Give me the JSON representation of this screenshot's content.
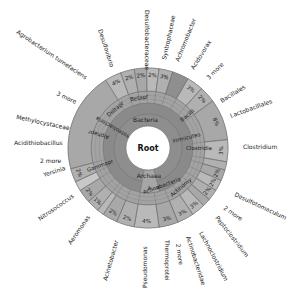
{
  "chart_data": {
    "type": "sunburst",
    "title": "",
    "center": {
      "x": 148,
      "y": 148
    },
    "root_label": "Root",
    "rings": {
      "root_r": 22,
      "domain": [
        22,
        34
      ],
      "phylum": [
        34,
        45
      ],
      "class": [
        45,
        57
      ],
      "order": [
        57,
        66
      ],
      "genus": [
        66,
        80
      ]
    },
    "colors": {
      "root": "#ffffff",
      "bacteria": "#8e8e8e",
      "archaea": "#a6a6a6",
      "ring_light": "#b9b9b9",
      "ring_mid": "#a3a3a3",
      "ring_dark": "#8a8a8a",
      "highlight": "#c8c8c8",
      "stroke": "#6e6e6e",
      "text": "#222222"
    },
    "domains": [
      {
        "label": "Bacteria",
        "start": -170,
        "end": 165
      },
      {
        "label": "Archaea",
        "start": 165,
        "end": 190
      }
    ],
    "inner_labels": [
      {
        "label": "Bacteria",
        "angle": -5,
        "r": 28
      },
      {
        "label": "Archaea",
        "angle": 178,
        "r": 28
      },
      {
        "label": "Proteobacteria",
        "angle": -60,
        "r": 40
      },
      {
        "label": "Firmicutes",
        "angle": 75,
        "r": 40
      },
      {
        "label": "Actinobacteria",
        "angle": 160,
        "r": 40
      },
      {
        "label": "A...a",
        "angle": 172,
        "r": 40
      },
      {
        "label": "Gammapr",
        "angle": -110,
        "r": 51
      },
      {
        "label": "Deltapr",
        "angle": -40,
        "r": 51
      },
      {
        "label": "Betapr",
        "angle": -10,
        "r": 51
      },
      {
        "label": "Alphapr",
        "angle": -75,
        "r": 51
      },
      {
        "label": "Clostridia",
        "angle": 90,
        "r": 51
      },
      {
        "label": "Bacilli",
        "angle": 50,
        "r": 51
      },
      {
        "label": "Actinomy",
        "angle": 140,
        "r": 51
      }
    ],
    "segments": [
      {
        "label": "Desulfovibrio",
        "pct": "4%",
        "start": -32,
        "end": -20
      },
      {
        "label": "Desulfobacteraceae",
        "pct": "2%",
        "start": -20,
        "end": -10
      },
      {
        "label": "Syntrophaceae",
        "pct": "2%",
        "start": -10,
        "end": -1
      },
      {
        "label": "Achromobacter",
        "pct": "2%",
        "start": -1,
        "end": 8
      },
      {
        "label": "Acidovorax",
        "pct": "3%",
        "start": 8,
        "end": 18
      },
      {
        "label": "3 more",
        "pct": "",
        "start": 18,
        "end": 30
      },
      {
        "label": "Bacillales",
        "pct": "3%",
        "start": 30,
        "end": 42
      },
      {
        "label": "Lactobacillales",
        "pct": "2%",
        "start": 42,
        "end": 54
      },
      {
        "label": "Clostridium",
        "pct": "8%",
        "start": 54,
        "end": 84
      },
      {
        "label": "Desulfotomaculum",
        "pct": "3%",
        "start": 84,
        "end": 100
      },
      {
        "label": "2 more",
        "pct": "",
        "start": 100,
        "end": 106
      },
      {
        "label": "Peptoclostridium",
        "pct": "2%",
        "start": 106,
        "end": 114
      },
      {
        "label": "Lachnoclostridium",
        "pct": "2%",
        "start": 114,
        "end": 122
      },
      {
        "label": "Actinobacteridae",
        "pct": "2%",
        "start": 122,
        "end": 130
      },
      {
        "label": "2 more",
        "pct": "",
        "start": 130,
        "end": 136
      },
      {
        "label": "Thermoprotei",
        "pct": "3%",
        "start": 136,
        "end": 146
      },
      {
        "label": "Pseudomonas",
        "pct": "3%",
        "start": 146,
        "end": 158
      },
      {
        "label": "Acinetobacter",
        "pct": "3%",
        "start": 158,
        "end": 172
      },
      {
        "label": "Aeromonas",
        "pct": "4%",
        "start": 172,
        "end": 190
      },
      {
        "label": "Nitrosococcus",
        "pct": "2%",
        "start": 190,
        "end": 203
      },
      {
        "label": "Yersinia",
        "pct": "2%",
        "start": 203,
        "end": 214
      },
      {
        "label": "2 more",
        "pct": "",
        "start": 214,
        "end": 219
      },
      {
        "label": "Acidithiobacillus",
        "pct": "1%",
        "start": 219,
        "end": 228
      },
      {
        "label": "Methylocystaceae",
        "pct": "2%",
        "start": 228,
        "end": 238
      },
      {
        "label": "3 more",
        "pct": "",
        "start": 238,
        "end": 245
      },
      {
        "label": "Agrobacterium tumefaciens",
        "pct": "2%",
        "start": 245,
        "end": 255
      },
      {
        "label": "Desulfovibrio",
        "pct": "",
        "start": 255,
        "end": 328
      }
    ],
    "outer_labels": [
      {
        "text": "Desulfovibrio",
        "x": 98,
        "y": 30,
        "rot": 72
      },
      {
        "text": "Desulfobacteraceae",
        "x": 145,
        "y": 10,
        "rot": 90
      },
      {
        "text": "Syntrophaceae",
        "x": 166,
        "y": 60,
        "rot": -78
      },
      {
        "text": "Achromobacter",
        "x": 179,
        "y": 62,
        "rot": -68
      },
      {
        "text": "Acidovorax",
        "x": 194,
        "y": 70,
        "rot": -58
      },
      {
        "text": "3 more",
        "x": 209,
        "y": 80,
        "rot": -45
      },
      {
        "text": "Bacillales",
        "x": 222,
        "y": 103,
        "rot": -32
      },
      {
        "text": "Lactobacillales",
        "x": 231,
        "y": 118,
        "rot": -20
      },
      {
        "text": "Clostridium",
        "x": 243,
        "y": 149,
        "rot": 0
      },
      {
        "text": "Desulfotomaculum",
        "x": 234,
        "y": 196,
        "rot": 25
      },
      {
        "text": "2 more",
        "x": 223,
        "y": 209,
        "rot": 35
      },
      {
        "text": "Peptoclostridium",
        "x": 215,
        "y": 218,
        "rot": 52
      },
      {
        "text": "Lachnoclostridium",
        "x": 199,
        "y": 233,
        "rot": 62
      },
      {
        "text": "Actinobacteridae",
        "x": 186,
        "y": 237,
        "rot": 72
      },
      {
        "text": "2 more",
        "x": 176,
        "y": 244,
        "rot": 82
      },
      {
        "text": "Thermoprotei",
        "x": 165,
        "y": 240,
        "rot": 90
      },
      {
        "text": "Pseudomonas",
        "x": 147,
        "y": 288,
        "rot": -90
      },
      {
        "text": "Acinetobacter",
        "x": 107,
        "y": 281,
        "rot": -74
      },
      {
        "text": "Aeromonas",
        "x": 71,
        "y": 245,
        "rot": -55
      },
      {
        "text": "Nitrosococcus",
        "x": 40,
        "y": 221,
        "rot": -35
      },
      {
        "text": "Yersinia",
        "x": 44,
        "y": 177,
        "rot": -18
      },
      {
        "text": "2 more",
        "x": 40,
        "y": 163,
        "rot": 0
      },
      {
        "text": "Acidithiobacillus",
        "x": 14,
        "y": 145,
        "rot": 0
      },
      {
        "text": "Methylocystaceae",
        "x": 16,
        "y": 119,
        "rot": 12
      },
      {
        "text": "3 more",
        "x": 56,
        "y": 95,
        "rot": 25
      },
      {
        "text": "Agrobacterium tumefaciens",
        "x": 16,
        "y": 33,
        "rot": 34
      }
    ]
  }
}
